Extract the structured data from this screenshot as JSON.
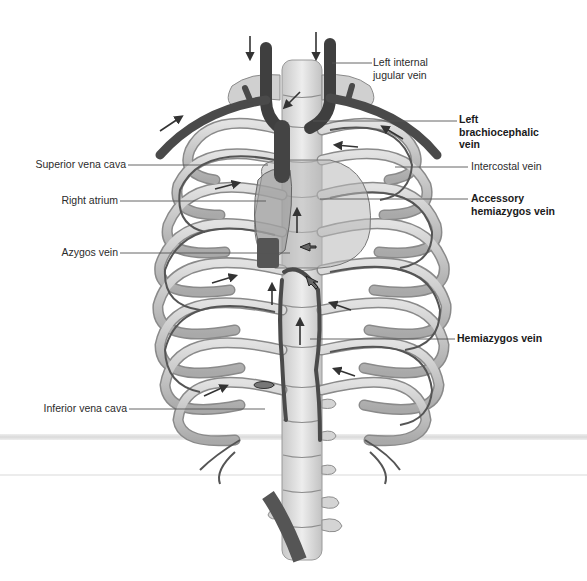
{
  "diagram": {
    "colors": {
      "vein": "#555555",
      "vein_dark": "#3f3f3f",
      "rib": "#c9c9c9",
      "rib_edge": "#8a8a8a",
      "spine": "#dcdcdc",
      "heart": "#bdbdbd",
      "leader_line": "#555555",
      "band": "#e4e4e4"
    },
    "labels": {
      "left_internal_jugular_vein": "Left internal\njugular vein",
      "left_brachiocephalic_vein": "Left\nbrachiocephalic\nvein",
      "intercostal_vein": "Intercostal vein",
      "accessory_hemiazygos_vein": "Accessory\nhemiazygos vein",
      "hemiazygos_vein": "Hemiazygos vein",
      "superior_vena_cava": "Superior vena cava",
      "right_atrium": "Right atrium",
      "azygos_vein": "Azygos vein",
      "inferior_vena_cava": "Inferior vena cava"
    }
  }
}
